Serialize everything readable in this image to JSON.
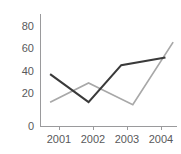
{
  "chart_data": {
    "type": "line",
    "title": "",
    "subtitle": "",
    "xlabel": "",
    "ylabel": "",
    "categories": [
      "2001",
      "2002",
      "2003",
      "2004"
    ],
    "x_tick_labels": [
      "2001",
      "2002",
      "2003",
      "2004"
    ],
    "y_tick_labels": [
      "0",
      "20",
      "40",
      "60",
      "80"
    ],
    "y_ticks": [
      0,
      20,
      40,
      60,
      80
    ],
    "ylim": [
      0,
      88
    ],
    "xlim": [
      2000.75,
      2004.3
    ],
    "grid": false,
    "legend": "none",
    "series": [
      {
        "name": "series-1",
        "color": "#3a3a3a",
        "x": [
          2001,
          2002,
          2002.85,
          2004
        ],
        "values": [
          41,
          19,
          48,
          54
        ]
      },
      {
        "name": "series-2",
        "color": "#a8a8a8",
        "x": [
          2001,
          2002,
          2003.15,
          2004.2
        ],
        "values": [
          19,
          34,
          17,
          66
        ]
      }
    ]
  },
  "axes": {
    "y_axis_name": "y-axis",
    "x_axis_name": "x-axis"
  }
}
